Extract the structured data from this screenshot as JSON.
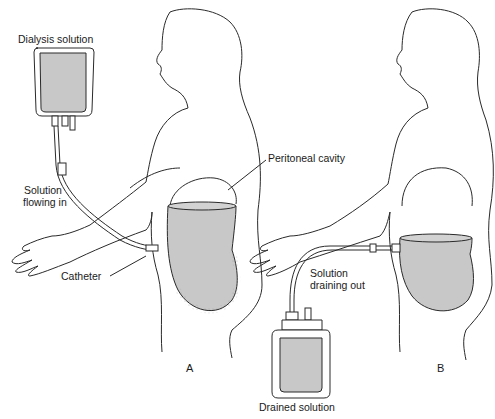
{
  "diagram": {
    "panels": [
      {
        "id": "A",
        "label": "A",
        "callouts": {
          "dialysis_solution": "Dialysis solution",
          "solution_flowing_in_line1": "Solution",
          "solution_flowing_in_line2": "flowing in",
          "peritoneal_cavity": "Peritoneal cavity",
          "catheter": "Catheter"
        }
      },
      {
        "id": "B",
        "label": "B",
        "callouts": {
          "solution_draining_out_line1": "Solution",
          "solution_draining_out_line2": "draining out",
          "drained_solution": "Drained solution"
        }
      }
    ],
    "colors": {
      "fluid": "#c8c8c8",
      "outline": "#2a2a2a",
      "background": "#ffffff"
    }
  }
}
